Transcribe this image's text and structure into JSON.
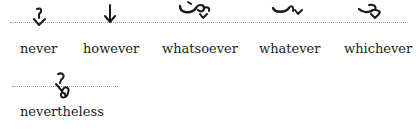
{
  "rows": [
    {
      "entries": [
        {
          "word": "never",
          "outline_icon": "never-shorthand-outline"
        },
        {
          "word": "however",
          "outline_icon": "however-shorthand-outline"
        },
        {
          "word": "whatsoever",
          "outline_icon": "whatsoever-shorthand-outline"
        },
        {
          "word": "whatever",
          "outline_icon": "whatever-shorthand-outline"
        },
        {
          "word": "whichever",
          "outline_icon": "whichever-shorthand-outline"
        }
      ]
    },
    {
      "entries": [
        {
          "word": "nevertheless",
          "outline_icon": "nevertheless-shorthand-outline"
        }
      ]
    }
  ],
  "colors": {
    "ink": "#1a1a1a",
    "baseline": "#9a9a9a",
    "background": "#ffffff"
  }
}
